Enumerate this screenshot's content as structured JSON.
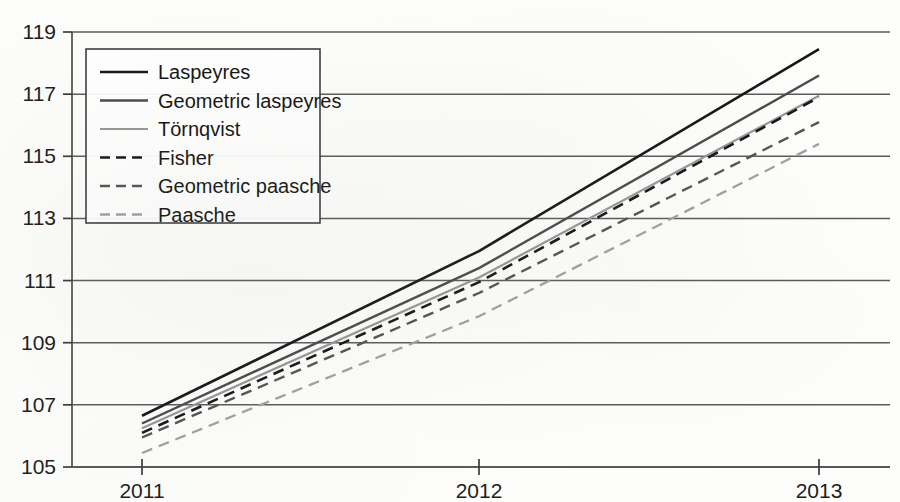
{
  "chart_data": {
    "type": "line",
    "title": "",
    "xlabel": "",
    "ylabel": "",
    "x": [
      "2011",
      "2012",
      "2013"
    ],
    "categories": [
      "2011",
      "2012",
      "2013"
    ],
    "xlim": [
      2011,
      2013
    ],
    "ylim": [
      105,
      119
    ],
    "yticks": [
      "119",
      "117",
      "115",
      "113",
      "111",
      "109",
      "107",
      "105"
    ],
    "ytick_values": [
      119,
      117,
      115,
      113,
      111,
      109,
      107,
      105
    ],
    "xticks": [
      "2011",
      "2012",
      "2013"
    ],
    "grid": "horizontal",
    "legend_position": "upper-left-inside",
    "series": [
      {
        "name": "Laspeyres",
        "values": [
          106.65,
          111.95,
          118.45
        ],
        "color": "#161616",
        "width": 2.6,
        "dash": "none"
      },
      {
        "name": "Geometric laspeyres",
        "values": [
          106.4,
          111.4,
          117.6
        ],
        "color": "#4a4a4a",
        "width": 2.4,
        "dash": "none"
      },
      {
        "name": "Törnqvist",
        "values": [
          106.25,
          111.1,
          116.95
        ],
        "color": "#969696",
        "width": 2.2,
        "dash": "none"
      },
      {
        "name": "Fisher",
        "values": [
          106.1,
          110.95,
          116.9
        ],
        "color": "#161616",
        "width": 2.6,
        "dash": "11,7"
      },
      {
        "name": "Geometric paasche",
        "values": [
          105.95,
          110.6,
          116.1
        ],
        "color": "#535353",
        "width": 2.4,
        "dash": "11,7"
      },
      {
        "name": "Paasche",
        "values": [
          105.45,
          109.85,
          115.4
        ],
        "color": "#a0a0a0",
        "width": 2.3,
        "dash": "11,7"
      }
    ]
  },
  "legend": {
    "entries": [
      {
        "label": "Laspeyres"
      },
      {
        "label": "Geometric laspeyres"
      },
      {
        "label": "Törnqvist"
      },
      {
        "label": "Fisher"
      },
      {
        "label": "Geometric paasche"
      },
      {
        "label": "Paasche"
      }
    ]
  },
  "axes": {
    "y_tick_labels": [
      "119",
      "117",
      "115",
      "113",
      "111",
      "109",
      "107",
      "105"
    ],
    "x_tick_labels": [
      "2011",
      "2012",
      "2013"
    ]
  }
}
